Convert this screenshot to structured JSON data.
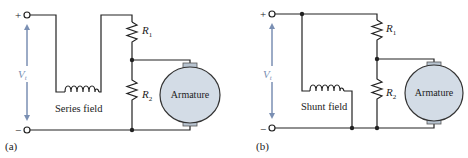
{
  "diagrams": [
    {
      "id": "a",
      "caption": "(a)",
      "plus": "+",
      "minus": "−",
      "voltage": {
        "symbol": "V",
        "sub": "t"
      },
      "field_label": "Series field",
      "r1": {
        "symbol": "R",
        "sub": "1"
      },
      "r2": {
        "symbol": "R",
        "sub": "2"
      },
      "armature_label": "Armature"
    },
    {
      "id": "b",
      "caption": "(b)",
      "plus": "+",
      "minus": "−",
      "voltage": {
        "symbol": "V",
        "sub": "t"
      },
      "field_label": "Shunt field",
      "r1": {
        "symbol": "R",
        "sub": "1"
      },
      "r2": {
        "symbol": "R",
        "sub": "2"
      },
      "armature_label": "Armature"
    }
  ],
  "colors": {
    "wire": "#222222",
    "voltage_arrow": "#7a8fb3",
    "armature_fill": "#d3dce6",
    "brush_fill": "#b8c4d0"
  }
}
